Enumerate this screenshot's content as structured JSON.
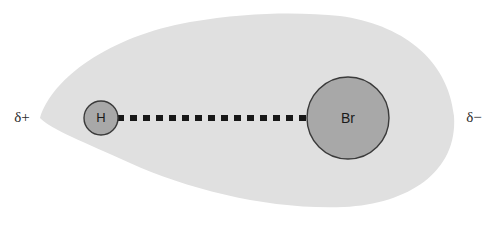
{
  "diagram": {
    "type": "molecule-polarity",
    "canvas": {
      "width": 499,
      "height": 230,
      "background": "#ffffff"
    },
    "electron_cloud": {
      "name": "electron-density-cloud",
      "shape": "teardrop",
      "fill": "#e0e0e0",
      "tip_x": 40,
      "right_edge_x": 455,
      "top_y": 13,
      "bottom_y": 205,
      "axis_y": 118,
      "description": "Shared electron cloud shifted toward bromine"
    },
    "atoms": [
      {
        "symbol": "H",
        "name": "hydrogen",
        "cx": 101,
        "cy": 118,
        "r": 17,
        "fill": "#a8a8a8",
        "stroke": "#3a3a3a",
        "partial_charge": "δ+"
      },
      {
        "symbol": "Br",
        "name": "bromine",
        "cx": 348,
        "cy": 118,
        "r": 41,
        "fill": "#a8a8a8",
        "stroke": "#3a3a3a",
        "partial_charge": "δ−"
      }
    ],
    "bond": {
      "name": "dashed-bond",
      "style": "square-dashed",
      "color": "#171717",
      "x_start": 117,
      "x_end": 308,
      "y": 118,
      "thickness": 6,
      "dash_length": 7,
      "gap_length": 6
    },
    "charge_labels": {
      "left": {
        "text": "δ+",
        "x": 22,
        "y": 118
      },
      "right": {
        "text": "δ−",
        "x": 474,
        "y": 118
      }
    }
  }
}
